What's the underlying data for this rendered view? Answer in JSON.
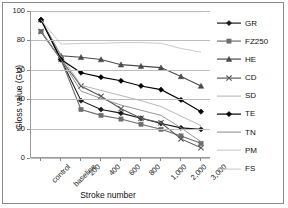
{
  "chart_data": {
    "type": "line",
    "title": "",
    "xlabel": "Stroke number",
    "ylabel": "Gloss value (GU)",
    "categories": [
      "control",
      "baseline",
      "200",
      "400",
      "600",
      "800",
      "1,000",
      "2,000",
      "3,000"
    ],
    "ylim": [
      0,
      100
    ],
    "yticks": [
      0,
      20,
      40,
      60,
      80,
      100
    ],
    "grid": true,
    "legend_position": "right",
    "series": [
      {
        "name": "GR",
        "marker": "diamond",
        "color": "#1a1a1a",
        "values": [
          94,
          67,
          39,
          33,
          30.5,
          27,
          23.5,
          20.5,
          19.5
        ]
      },
      {
        "name": "FZ250",
        "marker": "square",
        "color": "#6e6e6e",
        "values": [
          86,
          67,
          33,
          29,
          26.5,
          23,
          19.5,
          15,
          10
        ]
      },
      {
        "name": "HE",
        "marker": "triangle",
        "color": "#4a4a4a",
        "values": [
          94,
          69.5,
          68.5,
          67,
          63.5,
          62.5,
          61.5,
          55.5,
          49
        ]
      },
      {
        "name": "CD",
        "marker": "cross",
        "color": "#5a5a5a",
        "values": [
          86,
          67,
          49,
          42,
          33.5,
          27,
          24,
          13,
          7
        ]
      },
      {
        "name": "SD",
        "marker": "none",
        "color": "#b0b0b0",
        "values": [
          94,
          69.5,
          49.5,
          46,
          42.5,
          39,
          35,
          28.5,
          22
        ]
      },
      {
        "name": "TE",
        "marker": "diamond",
        "color": "#000000",
        "values": [
          94,
          67,
          58,
          55,
          52.5,
          49,
          46.5,
          39.5,
          31.5
        ]
      },
      {
        "name": "TN",
        "marker": "none",
        "color": "#8a8a8a",
        "values": [
          86,
          67,
          45.5,
          40.5,
          36,
          32.5,
          29,
          20.5,
          11
        ]
      },
      {
        "name": "PM",
        "marker": "none",
        "color": "#c4c4c4",
        "values": [
          94,
          77.5,
          78,
          78,
          78.5,
          78.5,
          78,
          74.5,
          72
        ]
      },
      {
        "name": "FS",
        "marker": "none",
        "color": "#c8c8c8",
        "values": [
          99.5,
          99.5,
          99.5,
          99.5,
          99.5,
          99.5,
          99.5,
          99.5,
          99.5
        ]
      }
    ]
  },
  "axes": {
    "y_tick_labels": [
      "100",
      "80",
      "60",
      "40",
      "20",
      "0"
    ],
    "y_title": "Gloss value (GU)",
    "x_title": "Stroke number",
    "x_tick_labels": [
      "control",
      "baseline",
      "200",
      "400",
      "600",
      "800",
      "1,000",
      "2,000",
      "3,000"
    ]
  },
  "legend": {
    "entries": [
      {
        "label": "GR"
      },
      {
        "label": "FZ250"
      },
      {
        "label": "HE"
      },
      {
        "label": "CD"
      },
      {
        "label": "SD"
      },
      {
        "label": "TE"
      },
      {
        "label": "TN"
      },
      {
        "label": "PM"
      },
      {
        "label": "FS"
      }
    ]
  }
}
